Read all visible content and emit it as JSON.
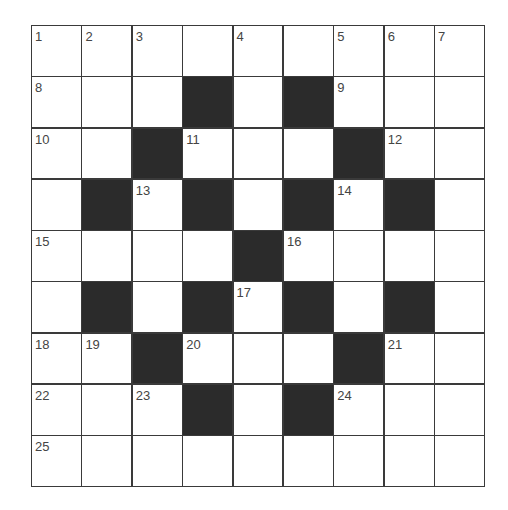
{
  "puzzle": {
    "rows": 9,
    "cols": 9,
    "colors": {
      "black": "#2b2b2b",
      "white": "#ffffff",
      "line": "#3a3a3a",
      "number": "#444444"
    },
    "grid": [
      [
        "1",
        "2",
        "3",
        "",
        "4",
        "",
        "5",
        "6",
        "7"
      ],
      [
        "8",
        "",
        "",
        "#",
        "",
        "#",
        "9",
        "",
        ""
      ],
      [
        "10",
        "",
        "#",
        "11",
        "",
        "",
        "#",
        "12",
        ""
      ],
      [
        "",
        "#",
        "13",
        "#",
        "",
        "#",
        "14",
        "#",
        ""
      ],
      [
        "15",
        "",
        "",
        "",
        "#",
        "16",
        "",
        "",
        ""
      ],
      [
        "",
        "#",
        "",
        "#",
        "17",
        "#",
        "",
        "#",
        ""
      ],
      [
        "18",
        "19",
        "#",
        "20",
        "",
        "",
        "#",
        "21",
        ""
      ],
      [
        "22",
        "",
        "23",
        "#",
        "",
        "#",
        "24",
        "",
        ""
      ],
      [
        "25",
        "",
        "",
        "",
        "",
        "",
        "",
        "",
        ""
      ]
    ]
  }
}
